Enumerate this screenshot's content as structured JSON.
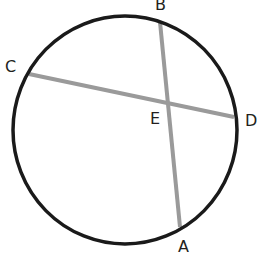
{
  "diagram": {
    "type": "circle-intersecting-chords",
    "circle": {
      "cx": 125,
      "cy": 130,
      "rx": 112,
      "ry": 114,
      "stroke": "#1a1a1a",
      "stroke_width": 3.5
    },
    "chords": [
      {
        "name": "CD",
        "from": "C",
        "to": "D",
        "x1": 29,
        "y1": 74,
        "x2": 234,
        "y2": 117,
        "stroke": "#9a9a9a"
      },
      {
        "name": "BA",
        "from": "B",
        "to": "A",
        "x1": 160,
        "y1": 22,
        "x2": 180,
        "y2": 227,
        "stroke": "#9a9a9a"
      }
    ],
    "intersection": {
      "label": "E"
    },
    "labels": {
      "B": "B",
      "C": "C",
      "D": "D",
      "E": "E",
      "A": "A"
    }
  }
}
